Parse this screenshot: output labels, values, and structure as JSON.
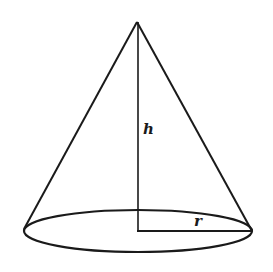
{
  "diagram": {
    "type": "geometry",
    "labels": {
      "height": "h",
      "radius": "r"
    },
    "colors": {
      "stroke": "#1a1a1a",
      "background": "#ffffff"
    }
  }
}
